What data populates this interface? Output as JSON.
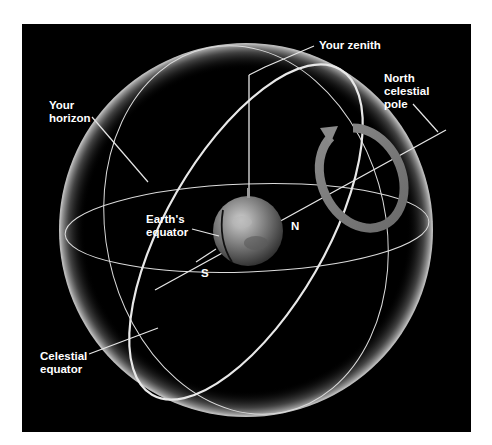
{
  "diagram": {
    "type": "celestial-sphere",
    "background": "#000000",
    "colors": {
      "sphere_glow": "#d8d8d8",
      "lines": "#e6e6e6",
      "rotation_arrow": "#7a7a7a",
      "label_text": "#ffffff"
    },
    "labels": {
      "zenith": "Your zenith",
      "ncp_line1": "North",
      "ncp_line2": "celestial",
      "ncp_line3": "pole",
      "horizon_line1": "Your",
      "horizon_line2": "horizon",
      "earth_eq_line1": "Earth's",
      "earth_eq_line2": "equator",
      "north": "N",
      "south": "S",
      "cel_eq_line1": "Celestial",
      "cel_eq_line2": "equator"
    }
  }
}
